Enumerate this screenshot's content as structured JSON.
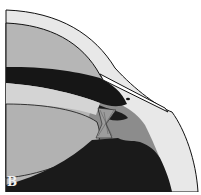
{
  "figure": {
    "panel_label": "B",
    "structures": [
      {
        "name": "cornea",
        "color": "#e6e6e6"
      },
      {
        "name": "anterior-chamber",
        "color": "#b4b4b4"
      },
      {
        "name": "iris",
        "color": "#161616"
      },
      {
        "name": "lens-capsule-anterior",
        "color": "#d2d2d2"
      },
      {
        "name": "lens",
        "color": "#b0b0b0"
      },
      {
        "name": "ciliary-body",
        "color": "#1a1a1a"
      },
      {
        "name": "sclera",
        "color": "#e8e8e8"
      },
      {
        "name": "posterior-chamber",
        "color": "#8a8a8a"
      },
      {
        "name": "zonules",
        "color": "#9a9a9a"
      },
      {
        "name": "incision-instrument",
        "color": "#ffffff"
      }
    ],
    "outline_color": "#111111"
  }
}
